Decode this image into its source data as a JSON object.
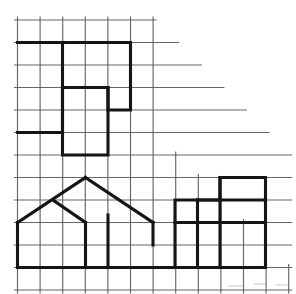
{
  "document": {
    "title": "Grid Figures Worksheet",
    "description": "Graph-paper grid with a stepped diagonal boundary in the upper right and three bold outlined figures drawn on the grid.",
    "background_color": "#ffffff",
    "grid_line_color": "#5a5a5a",
    "figure_line_color": "#151515"
  },
  "grid": {
    "name": "graph-paper-grid",
    "origin_x": 17.5,
    "origin_y": 20.0,
    "cell_width": 22.6,
    "cell_height": 22.5,
    "columns": 12,
    "rows": 12,
    "grid_line_width": 1.15,
    "staircase_boundary": true,
    "staircase_note": "Upper-right of the grid is cut away by a descending staircase; each successive row extends one column further right.",
    "row_extents": [
      6,
      7,
      8,
      9,
      10,
      11,
      12,
      12,
      12,
      12,
      12,
      12,
      12
    ],
    "column_extents": [
      12,
      12,
      12,
      12,
      12,
      12,
      12,
      6,
      5,
      4,
      3,
      2,
      1
    ]
  },
  "figures": [
    {
      "id": "figure-top-left",
      "name": "stepped-polygon-upper-left",
      "label": "Upper-left stepped polygon",
      "line_width": 3.1,
      "outline_cells": [
        [
          0,
          1
        ],
        [
          5,
          1
        ],
        [
          5,
          4
        ],
        [
          4,
          4
        ],
        [
          4,
          3
        ],
        [
          2,
          3
        ],
        [
          2,
          5
        ],
        [
          0,
          5
        ]
      ],
      "interior_cells": [
        [
          2,
          3
        ],
        [
          2,
          6
        ],
        [
          4,
          6
        ],
        [
          4,
          3
        ]
      ],
      "vertical_divider": [
        [
          2,
          1
        ],
        [
          2,
          3
        ]
      ]
    },
    {
      "id": "figure-house",
      "name": "house-with-peaked-roof",
      "label": "Lower-left house with peaked roof",
      "line_width": 3.1,
      "base_line": [
        [
          0,
          11
        ],
        [
          7,
          11
        ]
      ],
      "left_wall": [
        [
          0,
          9
        ],
        [
          0,
          11
        ]
      ],
      "roof_left_slope": [
        [
          0,
          9
        ],
        [
          3,
          7
        ]
      ],
      "roof_right_slope": [
        [
          3,
          7
        ],
        [
          6,
          9
        ]
      ],
      "roof_peak_cell": [
        3,
        7
      ],
      "inner_gable_slope": [
        [
          1.6,
          8
        ],
        [
          3,
          9
        ]
      ],
      "inner_vertical_left": [
        [
          3,
          9
        ],
        [
          3,
          11
        ]
      ],
      "inner_vertical_right": [
        [
          4,
          9
        ],
        [
          4,
          11
        ]
      ],
      "right_post": [
        [
          6,
          9
        ],
        [
          6,
          11
        ]
      ]
    },
    {
      "id": "figure-bottom-right",
      "name": "stepped-block-lower-right",
      "label": "Lower-right stepped block figure",
      "line_width": 3.1,
      "outline_cells": [
        [
          8,
          9
        ],
        [
          10,
          9
        ],
        [
          10,
          8
        ],
        [
          12,
          8
        ],
        [
          12,
          12
        ],
        [
          8,
          12
        ]
      ],
      "interior_horizontal": [
        [
          8,
          10
        ],
        [
          12,
          10
        ]
      ],
      "interior_vertical_a": [
        [
          10,
          9
        ],
        [
          10,
          12
        ]
      ],
      "interior_vertical_b": [
        [
          11,
          9
        ],
        [
          11,
          12
        ]
      ],
      "top_shelf": [
        [
          10,
          8
        ],
        [
          12,
          8
        ]
      ]
    }
  ],
  "annotations": {
    "scan_artifact_note": "Faint scanner smudges along the lower edge of the page.",
    "visible_text": ""
  }
}
